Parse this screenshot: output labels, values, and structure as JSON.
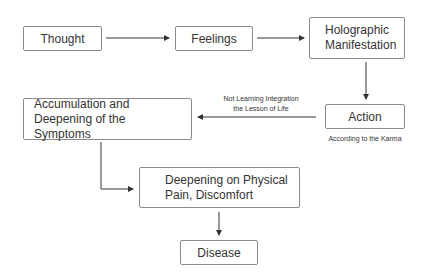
{
  "diagram": {
    "nodes": {
      "thought": "Thought",
      "feelings": "Feelings",
      "holographic": "Holographic Manifestation",
      "action": "Action",
      "accumulation": "Accumulation and Deepening of the Symptoms",
      "deepening": "Deepening on Physical Pain, Discomfort",
      "disease": "Disease"
    },
    "labels": {
      "not_learning_1": "Not Learning Integration",
      "not_learning_2": "the Lesson of Life",
      "karma": "According to the Karma"
    },
    "edges": [
      {
        "from": "thought",
        "to": "feelings"
      },
      {
        "from": "feelings",
        "to": "holographic"
      },
      {
        "from": "holographic",
        "to": "action"
      },
      {
        "from": "action",
        "to": "accumulation"
      },
      {
        "from": "accumulation",
        "to": "deepening"
      },
      {
        "from": "deepening",
        "to": "disease"
      }
    ]
  }
}
